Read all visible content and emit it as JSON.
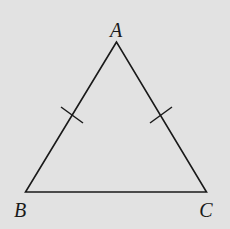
{
  "diagram": {
    "type": "isosceles-triangle",
    "background": "#e2e2e2",
    "stroke": "#1a1a1a",
    "vertices": {
      "A": {
        "x": 116.5,
        "y": 42,
        "label": "A",
        "label_x": 116,
        "label_y": 37
      },
      "B": {
        "x": 25.5,
        "y": 192,
        "label": "B",
        "label_x": 20,
        "label_y": 217
      },
      "C": {
        "x": 206.5,
        "y": 192,
        "label": "C",
        "label_x": 206,
        "label_y": 217
      }
    },
    "tick_marks": [
      {
        "side": "AB",
        "x1": 61,
        "y1": 107,
        "x2": 83,
        "y2": 123
      },
      {
        "side": "AC",
        "x1": 150,
        "y1": 123,
        "x2": 172,
        "y2": 107
      }
    ],
    "labels": [
      "A",
      "B",
      "C"
    ]
  }
}
